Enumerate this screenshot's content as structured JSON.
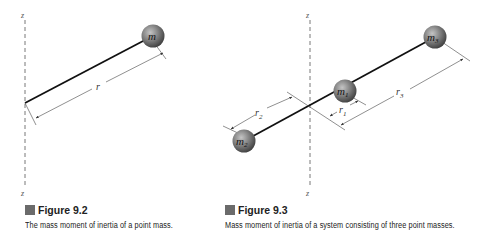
{
  "figure_9_2": {
    "title": "Figure 9.2",
    "caption": "The mass moment of inertia of a point mass.",
    "axis_label_top": "z",
    "axis_label_bottom": "z",
    "mass_label": "m",
    "distance_label": "r"
  },
  "figure_9_3": {
    "title": "Figure 9.3",
    "caption": "Mass moment of inertia of a system consisting of three point masses.",
    "axis_label_top": "z",
    "axis_label_bottom": "z",
    "masses": [
      {
        "label": "m",
        "sub": "1"
      },
      {
        "label": "m",
        "sub": "2"
      },
      {
        "label": "m",
        "sub": "3"
      }
    ],
    "distances": [
      {
        "label": "r",
        "sub": "1"
      },
      {
        "label": "r",
        "sub": "2"
      },
      {
        "label": "r",
        "sub": "3"
      }
    ]
  },
  "colors": {
    "caption_box": "#6b6b6b",
    "sphere_dark": "#4a4a4a",
    "sphere_light": "#b5b5b5",
    "rod": "#111111"
  }
}
